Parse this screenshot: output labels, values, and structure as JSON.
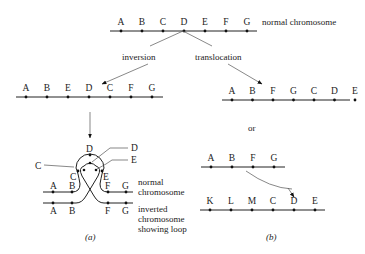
{
  "normal": {
    "genes": [
      "A",
      "B",
      "C",
      "D",
      "E",
      "F",
      "G"
    ],
    "label": "normal chromosome"
  },
  "branches": {
    "inversion_label": "inversion",
    "translocation_label": "translocation"
  },
  "inverted": {
    "genes": [
      "A",
      "B",
      "E",
      "D",
      "C",
      "F",
      "G"
    ]
  },
  "translocated": {
    "genes": [
      "A",
      "B",
      "F",
      "G",
      "C",
      "D",
      "E"
    ]
  },
  "or_label": "or",
  "translocation_pair": {
    "top_genes": [
      "A",
      "B",
      "F",
      "G"
    ],
    "bottom_genes": [
      "K",
      "L",
      "M",
      "C",
      "D",
      "E"
    ]
  },
  "loop": {
    "callouts": [
      "C",
      "D",
      "E"
    ],
    "inner_labels": [
      "C",
      "D",
      "E"
    ],
    "top_strand": [
      "A",
      "B",
      "F",
      "G"
    ],
    "bottom_strand": [
      "A",
      "B",
      "F",
      "G"
    ],
    "normal_label_1": "normal",
    "normal_label_2": "chromosome",
    "inverted_label_1": "inverted",
    "inverted_label_2": "chromosome",
    "inverted_label_3": "showing loop"
  },
  "captions": {
    "a": "(a)",
    "b": "(b)"
  }
}
